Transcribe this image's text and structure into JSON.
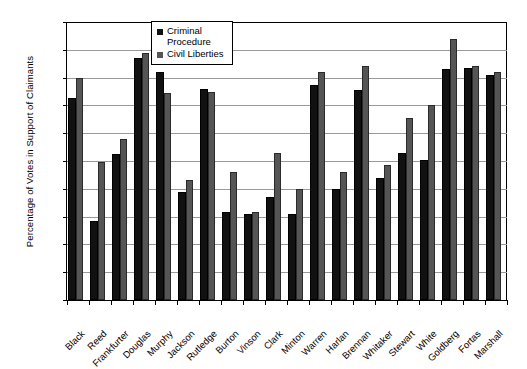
{
  "chart_data": {
    "type": "bar",
    "title": "",
    "xlabel": "",
    "ylabel": "Percentage of Votes in Support of Claimants",
    "ylim": [
      0,
      100
    ],
    "ytick_labels": [
      "100%",
      "90%",
      "80%",
      "70%",
      "60%",
      "50%",
      "40%",
      "30%",
      "20%",
      "10%",
      "0%"
    ],
    "ytick_values": [
      100,
      90,
      80,
      70,
      60,
      50,
      40,
      30,
      20,
      10,
      0
    ],
    "grid": "horizontal",
    "legend_position": "top-center",
    "categories": [
      "Black",
      "Reed",
      "Frankfurter",
      "Douglas",
      "Murphy",
      "Jackson",
      "Rutledge",
      "Burton",
      "Vinson",
      "Clark",
      "Minton",
      "Warren",
      "Harlan",
      "Brennan",
      "Whitaker",
      "Stewart",
      "White",
      "Goldberg",
      "Fortas",
      "Marshall"
    ],
    "series": [
      {
        "name": "Criminal Procedure",
        "color": "#111111",
        "values": [
          72.5,
          28.5,
          52.5,
          87,
          82,
          39,
          76,
          31.5,
          31,
          37,
          31,
          77.5,
          40,
          75.5,
          44,
          53,
          50.5,
          83,
          83.5,
          81
        ]
      },
      {
        "name": "Civil Liberties",
        "color": "#555555",
        "values": [
          80,
          49.5,
          58,
          89,
          74.5,
          43,
          75,
          46,
          31.5,
          53,
          40,
          82,
          46,
          84,
          48.5,
          65.5,
          70,
          94,
          84,
          82
        ]
      }
    ]
  },
  "legend": {
    "items": [
      {
        "label": "Criminal\nProcedure"
      },
      {
        "label": "Civil Liberties"
      }
    ]
  }
}
